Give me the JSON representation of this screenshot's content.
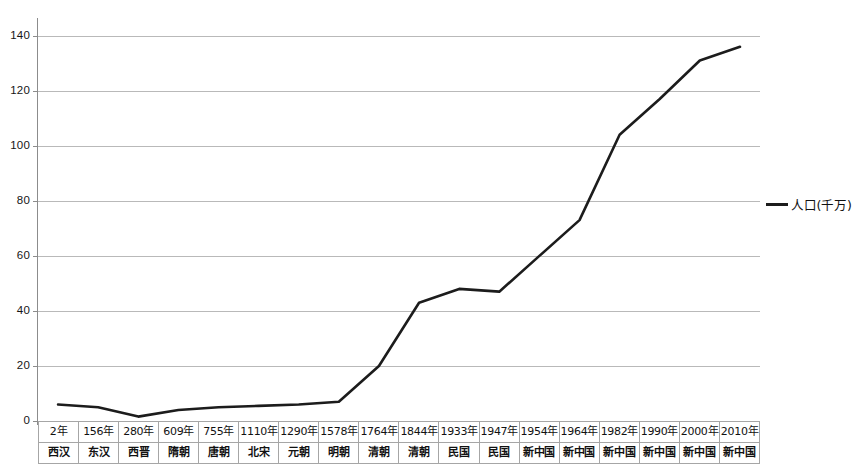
{
  "chart_data": {
    "type": "line",
    "title": "",
    "xlabel": "",
    "ylabel": "",
    "ylim": [
      0,
      145
    ],
    "y_ticks": [
      0,
      20,
      40,
      60,
      80,
      100,
      120,
      140
    ],
    "grid": true,
    "legend_position": "right",
    "legend": [
      "人口(千万)"
    ],
    "categories": [
      "2年",
      "156年",
      "280年",
      "609年",
      "755年",
      "1110年",
      "1290年",
      "1578年",
      "1764年",
      "1844年",
      "1933年",
      "1947年",
      "1954年",
      "1964年",
      "1982年",
      "1990年",
      "2000年",
      "2010年"
    ],
    "category_sublabels": [
      "西汉",
      "东汉",
      "西晋",
      "隋朝",
      "唐朝",
      "北宋",
      "元朝",
      "明朝",
      "清朝",
      "清朝",
      "民国",
      "民国",
      "新中国",
      "新中国",
      "新中国",
      "新中国",
      "新中国",
      "新中国"
    ],
    "series": [
      {
        "name": "人口(千万)",
        "color": "#1c1c1c",
        "values": [
          6,
          5,
          1.6,
          4,
          5,
          5.5,
          6,
          7,
          20,
          43,
          48,
          47,
          60,
          73,
          104,
          117,
          131,
          136
        ]
      }
    ]
  },
  "axis": {
    "y_tick_labels": [
      "0",
      "20",
      "40",
      "60",
      "80",
      "100",
      "120",
      "140"
    ]
  },
  "legend": {
    "series_label": "人口(千万)"
  }
}
